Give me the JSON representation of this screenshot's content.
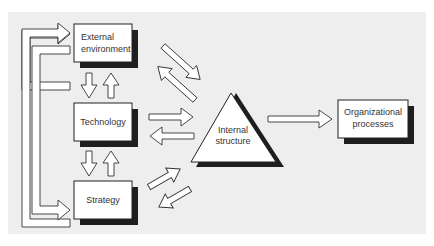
{
  "diagram": {
    "background_color": "#eeeeee",
    "shadow_color": "#1e1e1e",
    "nodes": {
      "external_environment": {
        "line1": "External",
        "line2": "environment"
      },
      "technology": {
        "label": "Technology"
      },
      "strategy": {
        "label": "Strategy"
      },
      "internal_structure": {
        "line1": "Internal",
        "line2": "structure"
      },
      "organizational_processes": {
        "line1": "Organizational",
        "line2": "processes"
      }
    },
    "edges": [
      {
        "from": "External environment",
        "to": "Technology",
        "bidirectional": true
      },
      {
        "from": "Technology",
        "to": "Strategy",
        "bidirectional": true
      },
      {
        "from": "External environment",
        "to": "Internal structure",
        "bidirectional": true
      },
      {
        "from": "Technology",
        "to": "Internal structure",
        "bidirectional": true
      },
      {
        "from": "Strategy",
        "to": "Internal structure",
        "bidirectional": true
      },
      {
        "from": "Internal structure",
        "to": "Organizational processes",
        "bidirectional": false
      },
      {
        "from": "Strategy",
        "to": "External environment",
        "bidirectional": false,
        "route": "outer-left"
      },
      {
        "from": "External environment",
        "to": "Strategy",
        "bidirectional": false,
        "route": "inner-left"
      }
    ]
  }
}
